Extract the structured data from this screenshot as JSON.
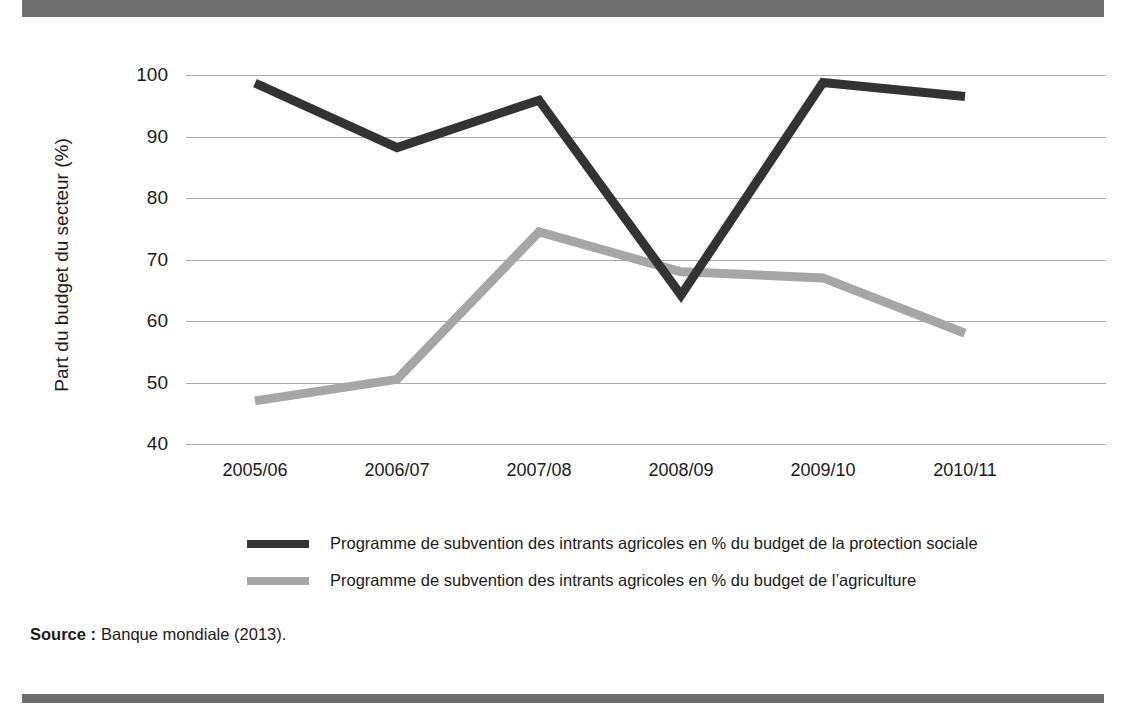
{
  "figure": {
    "banner_title": "",
    "source_label": "Source :",
    "source_text": "Banque mondiale (2013)."
  },
  "colors": {
    "banner": "#6f6f6f",
    "series_dark": "#333333",
    "series_grey": "#a6a6a6",
    "gridline": "#a8a8a8",
    "text": "#1a1a1a",
    "background": "#ffffff"
  },
  "chart_data": {
    "type": "line",
    "title": "",
    "xlabel": "",
    "ylabel": "Part du budget du secteur (%)",
    "categories": [
      "2005/06",
      "2006/07",
      "2007/08",
      "2008/09",
      "2009/10",
      "2010/11"
    ],
    "ylim": [
      40,
      100
    ],
    "yticks": [
      40,
      50,
      60,
      70,
      80,
      90,
      100
    ],
    "grid": true,
    "legend_position": "bottom",
    "series": [
      {
        "name": "Programme de subvention des intrants agricoles en % du budget de la protection sociale",
        "color": "#333333",
        "values": [
          98.7,
          88.2,
          95.9,
          64.2,
          98.8,
          96.5
        ]
      },
      {
        "name": "Programme de subvention des intrants agricoles en % du budget de l’agriculture",
        "color": "#a6a6a6",
        "values": [
          47.0,
          50.5,
          74.5,
          68.0,
          67.0,
          58.0
        ]
      }
    ]
  }
}
